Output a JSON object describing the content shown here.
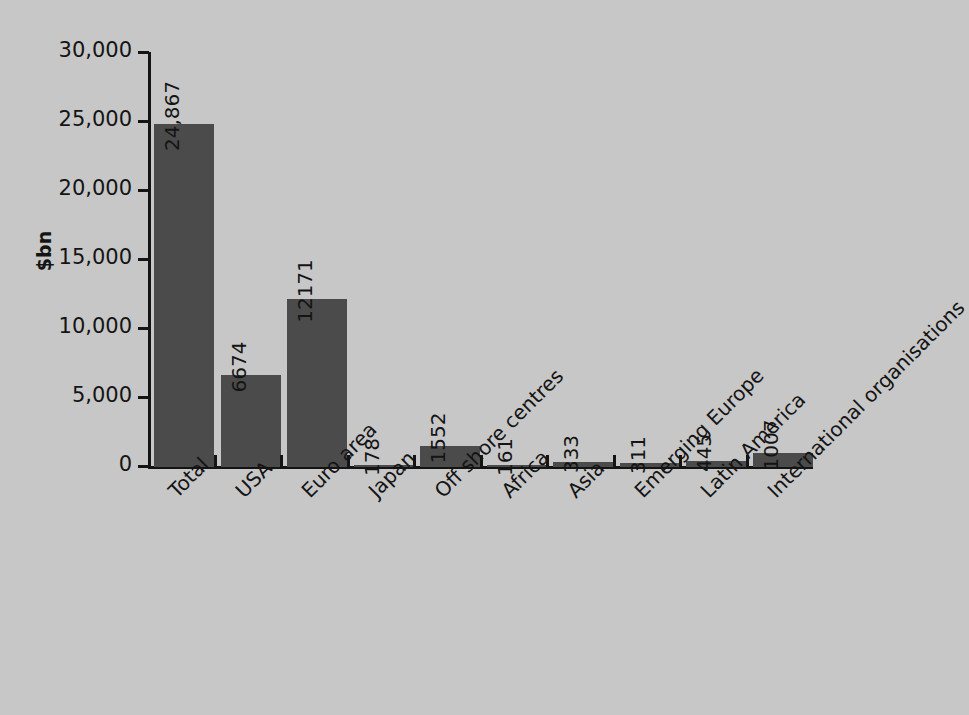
{
  "chart_data": {
    "type": "bar",
    "title": "",
    "subtitle": "",
    "xlabel": "",
    "ylabel": "$bn",
    "ylim": [
      0,
      30000
    ],
    "grid": false,
    "legend": null,
    "orientation": "vertical",
    "bar_color": "#4b4b4b",
    "background_color": "#c7c7c7",
    "text_color": "#141414",
    "value_label_rotation": -90,
    "category_label_rotation": -45,
    "categories": [
      "Total",
      "USA",
      "Euro area",
      "Japan",
      "Off shore centres",
      "Africa",
      "Asia",
      "Emerging Europe",
      "Latin America",
      "International organisations"
    ],
    "values": [
      24867,
      6674,
      12171,
      178,
      1552,
      161,
      333,
      311,
      445,
      1007
    ],
    "value_labels": [
      "24,867",
      "6674",
      "12171",
      "178",
      "1552",
      "161",
      "333",
      "311",
      "445",
      "1007"
    ],
    "y_ticks": [
      0,
      5000,
      10000,
      15000,
      20000,
      25000,
      30000
    ],
    "y_tick_labels": [
      "0",
      "5,000",
      "10,000",
      "15,000",
      "20,000",
      "25,000",
      "30,000"
    ]
  }
}
